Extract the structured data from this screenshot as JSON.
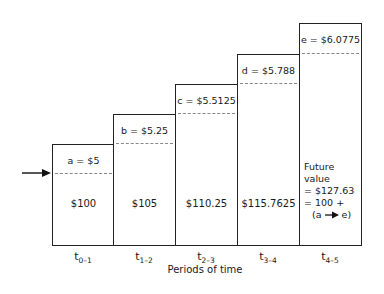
{
  "diagram": {
    "type": "compound-interest-staircase",
    "boxes": [
      {
        "increment": "a = $5",
        "amount": "$100",
        "period_base": "t",
        "period_sub": "0–1"
      },
      {
        "increment": "b = $5.25",
        "amount": "$105",
        "period_base": "t",
        "period_sub": "1–2"
      },
      {
        "increment": "c = $5.5125",
        "amount": "$110.25",
        "period_base": "t",
        "period_sub": "2–3"
      },
      {
        "increment": "d = $5.788",
        "amount": "$115.7625",
        "period_base": "t",
        "period_sub": "3–4"
      },
      {
        "increment": "e = $6.0775",
        "amount": "",
        "period_base": "t",
        "period_sub": "4–5"
      }
    ],
    "future_value": {
      "line1": "Future value",
      "line2": "= $127.63",
      "line3": "= 100 +",
      "line4_left": "(a",
      "line4_right": "e)"
    },
    "xlabel": "Periods of time"
  }
}
